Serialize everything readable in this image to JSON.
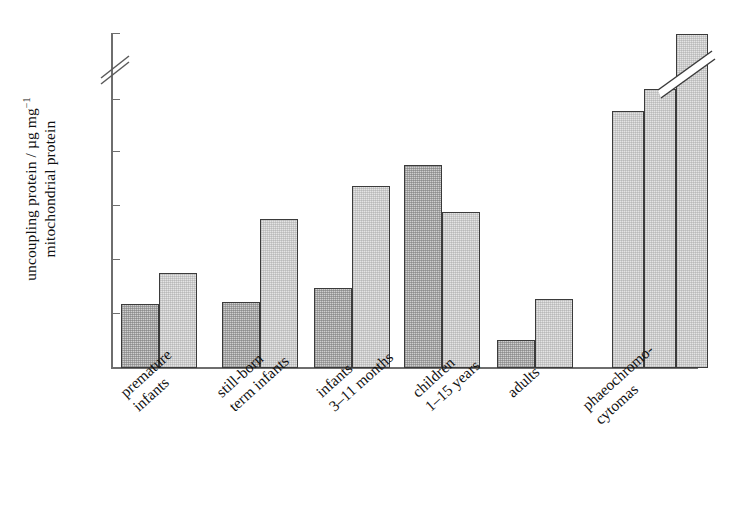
{
  "chart_data": {
    "type": "bar",
    "title": "",
    "xlabel": "",
    "ylabel_line1": "uncoupling protein / µg mg",
    "ylabel_sup": "−1",
    "ylabel_line2": "mitochondrial protein",
    "ylabel_full": "uncoupling protein / µg mg⁻¹ mitochondrial protein",
    "ylim": [
      0,
      50
    ],
    "y_axis_break": {
      "present": true,
      "between": [
        25,
        50
      ]
    },
    "grid": false,
    "legend": "none",
    "tick_labels": [
      "0",
      "5",
      "10",
      "15",
      "20",
      "25",
      "50"
    ],
    "tick_values": [
      0,
      5,
      10,
      15,
      20,
      25,
      50
    ],
    "categories": [
      "premature\ninfants",
      "still-born\nterm infants",
      "infants\n3–11 months",
      "children\n1–15 years",
      "adults",
      "phaeochromo-\ncytomas"
    ],
    "groups": [
      {
        "category": "premature infants",
        "values": [
          6.0,
          8.9
        ]
      },
      {
        "category": "still-born term infants",
        "values": [
          6.2,
          13.9
        ]
      },
      {
        "category": "infants 3–11 months",
        "values": [
          7.5,
          17.0
        ]
      },
      {
        "category": "children 1–15 years",
        "values": [
          18.9,
          14.6
        ]
      },
      {
        "category": "adults",
        "values": [
          2.6,
          6.4
        ]
      },
      {
        "category": "phaeochromocytomas",
        "values": [
          24.0,
          26.0,
          50.0
        ]
      }
    ],
    "bar_shades": [
      "dark",
      "light"
    ],
    "phaeochromocytoma_bar_shades": [
      "light",
      "light",
      "light"
    ],
    "colors": {
      "bar_dark_fill": "#cfcfcf",
      "bar_light_fill": "#e4e4e4",
      "bar_edge": "#3b3b3b",
      "axis": "#6e6e6e",
      "text": "#111111",
      "background": "#ffffff"
    }
  }
}
